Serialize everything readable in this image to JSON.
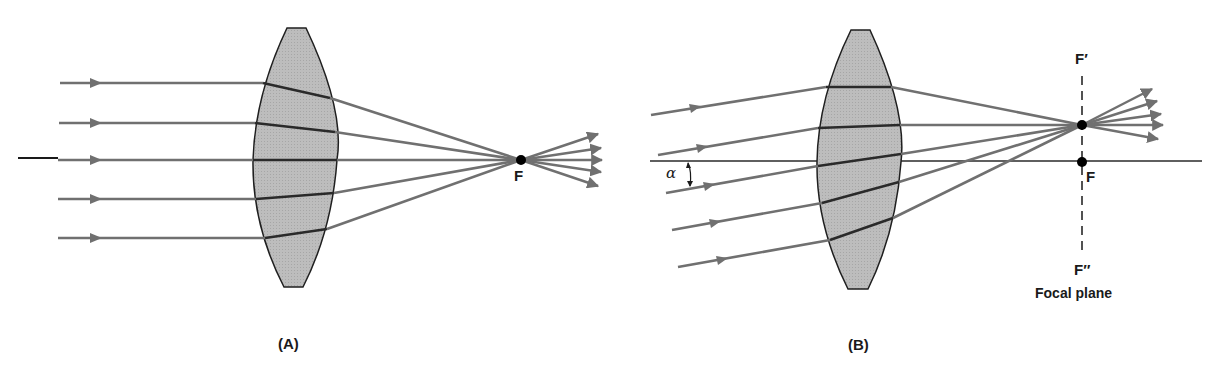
{
  "diagram": {
    "type": "optics-ray-diagram",
    "colors": {
      "ray": "#707070",
      "lens_fill": "#b8b8b8",
      "lens_stroke": "#1f1f1f",
      "axis": "#2a2a2a",
      "focal_point": "#000000"
    },
    "panel_a": {
      "caption": "(A)",
      "focal_label": "F",
      "description": "Parallel rays along the optical axis converge at focal point F",
      "ray_count": 5
    },
    "panel_b": {
      "caption": "(B)",
      "focal_label": "F",
      "focal_prime_label": "F′",
      "focal_double_prime_label": "F″",
      "focal_plane_label": "Focal plane",
      "angle_label": "α",
      "description": "Parallel oblique rays at angle α converge at point F′ on the focal plane",
      "ray_count": 5
    }
  }
}
